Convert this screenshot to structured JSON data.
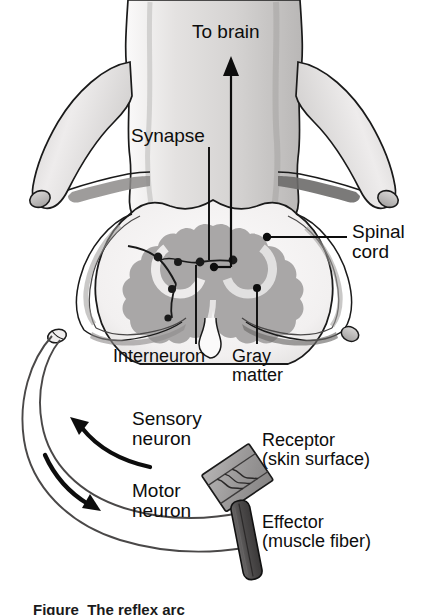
{
  "figure": {
    "caption_partial": "Figure  The reflex arc",
    "background": "#ffffff",
    "ink": "#0d0d0d"
  },
  "palette": {
    "bone_light": "#eceaea",
    "bone_mid": "#d2d0cf",
    "bone_shadow": "#9c9a99",
    "bone_dark": "#6f6d6d",
    "gray_matter": "#a9a7a7",
    "gray_matter_edge": "#bcbaba",
    "cord_white": "#f6f5f5",
    "receptor_fill": "#a3a1a1",
    "receptor_shade": "#8b8989",
    "effector_fill": "#555353",
    "outline": "#1a1a1a",
    "neuron_line": "#4a4848"
  },
  "labels": {
    "to_brain": "To brain",
    "synapse": "Synapse",
    "spinal_cord_line1": "Spinal",
    "spinal_cord_line2": "cord",
    "interneuron": "Interneuron",
    "gray_matter_line1": "Gray",
    "gray_matter_line2": "matter",
    "sensory_line1": "Sensory",
    "sensory_line2": "neuron",
    "motor_line1": "Motor",
    "motor_line2": "neuron",
    "receptor_line1": "Receptor",
    "receptor_line2": "(skin surface)",
    "effector_line1": "Effector",
    "effector_line2": "(muscle fiber)"
  },
  "anatomy": {
    "structures": [
      "vertebra",
      "transverse-process-left",
      "transverse-process-right",
      "spinal-cord-cross-section",
      "gray-matter-butterfly",
      "dorsal-root-ganglion",
      "sensory-neuron-arc",
      "motor-neuron-arc",
      "interneuron-cell-bodies",
      "synapse-terminals",
      "receptor-skin-patch",
      "effector-muscle-fiber"
    ],
    "flow": [
      {
        "from": "receptor",
        "to": "spinal-cord",
        "via": "sensory-neuron",
        "direction": "inward"
      },
      {
        "from": "spinal-cord",
        "to": "effector",
        "via": "motor-neuron",
        "direction": "outward"
      },
      {
        "from": "spinal-cord",
        "to": "brain",
        "via": "ascending-tract",
        "direction": "up"
      }
    ]
  }
}
